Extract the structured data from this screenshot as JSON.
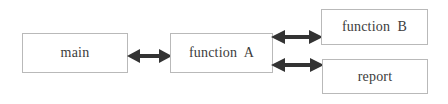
{
  "diagram": {
    "type": "block-flow-diagram",
    "background_color": "#ffffff",
    "node_border_color": "#b9b9b9",
    "node_fill_color": "#ffffff",
    "text_color": "#3c3c3c",
    "arrow_color": "#333333",
    "nodes": [
      {
        "id": "main",
        "label": "main"
      },
      {
        "id": "funcA",
        "label": "function  A"
      },
      {
        "id": "funcB",
        "label": "function  B"
      },
      {
        "id": "report",
        "label": "report"
      }
    ],
    "connectors": [
      {
        "id": "main-funcA",
        "from": "main",
        "to": "funcA",
        "style": "double-headed-arrow"
      },
      {
        "id": "funcA-funcB",
        "from": "funcA",
        "to": "funcB",
        "style": "double-headed-arrow"
      },
      {
        "id": "funcA-report",
        "from": "funcA",
        "to": "report",
        "style": "double-headed-arrow"
      }
    ]
  }
}
